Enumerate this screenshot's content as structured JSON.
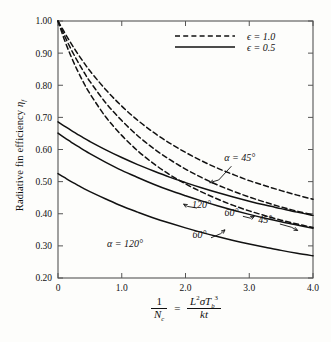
{
  "chart_data": {
    "type": "line",
    "title": "",
    "xlabel": "1/Nc = L^2 sigma Tb^3 / (k t)",
    "ylabel": "Radiative fin efficiency eta_f",
    "xlim": [
      0,
      4.0
    ],
    "ylim": [
      0.2,
      1.0
    ],
    "grid": false,
    "xticks": [
      "0",
      "1.0",
      "2.0",
      "3.0",
      "4.0"
    ],
    "xtick_values": [
      0,
      1.0,
      2.0,
      3.0,
      4.0
    ],
    "yticks": [
      "0.20",
      "0.30",
      "0.40",
      "0.50",
      "0.60",
      "0.70",
      "0.80",
      "0.90",
      "1.00"
    ],
    "ytick_values": [
      0.2,
      0.3,
      0.4,
      0.5,
      0.6,
      0.7,
      0.8,
      0.9,
      1.0
    ],
    "legend_position": "top-right",
    "x": [
      0,
      0.1,
      0.2,
      0.3,
      0.4,
      0.5,
      0.75,
      1.0,
      1.25,
      1.5,
      1.75,
      2.0,
      2.25,
      2.5,
      2.75,
      3.0,
      3.25,
      3.5,
      3.75,
      4.0
    ],
    "series": [
      {
        "name": "eps = 1.0, alpha = 45 deg",
        "emissivity": 1.0,
        "alpha_deg": 45,
        "style": "dashed",
        "values": [
          1.0,
          0.965,
          0.932,
          0.901,
          0.872,
          0.845,
          0.786,
          0.735,
          0.691,
          0.653,
          0.62,
          0.591,
          0.565,
          0.542,
          0.522,
          0.503,
          0.487,
          0.472,
          0.458,
          0.445
        ]
      },
      {
        "name": "eps = 1.0, alpha = 60 deg",
        "emissivity": 1.0,
        "alpha_deg": 60,
        "style": "dashed",
        "values": [
          1.0,
          0.955,
          0.914,
          0.877,
          0.843,
          0.812,
          0.745,
          0.69,
          0.643,
          0.603,
          0.569,
          0.539,
          0.513,
          0.49,
          0.47,
          0.452,
          0.436,
          0.421,
          0.408,
          0.396
        ]
      },
      {
        "name": "eps = 1.0, alpha = 120 deg",
        "emissivity": 1.0,
        "alpha_deg": 120,
        "style": "dashed",
        "values": [
          1.0,
          0.942,
          0.892,
          0.848,
          0.809,
          0.774,
          0.701,
          0.644,
          0.596,
          0.556,
          0.522,
          0.493,
          0.468,
          0.446,
          0.426,
          0.409,
          0.394,
          0.38,
          0.368,
          0.357
        ]
      },
      {
        "name": "eps = 0.5, alpha = 45 deg",
        "emissivity": 0.5,
        "alpha_deg": 45,
        "style": "solid",
        "values": [
          0.686,
          0.673,
          0.66,
          0.648,
          0.636,
          0.625,
          0.599,
          0.575,
          0.553,
          0.533,
          0.514,
          0.497,
          0.481,
          0.466,
          0.452,
          0.439,
          0.427,
          0.416,
          0.405,
          0.395
        ]
      },
      {
        "name": "eps = 0.5, alpha = 60 deg",
        "emissivity": 0.5,
        "alpha_deg": 60,
        "style": "solid",
        "values": [
          0.651,
          0.637,
          0.624,
          0.611,
          0.599,
          0.587,
          0.56,
          0.535,
          0.513,
          0.492,
          0.473,
          0.456,
          0.44,
          0.425,
          0.411,
          0.398,
          0.386,
          0.375,
          0.365,
          0.355
        ]
      },
      {
        "name": "eps = 0.5, alpha = 120 deg",
        "emissivity": 0.5,
        "alpha_deg": 120,
        "style": "solid",
        "values": [
          0.525,
          0.513,
          0.501,
          0.49,
          0.479,
          0.469,
          0.446,
          0.424,
          0.405,
          0.387,
          0.371,
          0.356,
          0.342,
          0.329,
          0.317,
          0.306,
          0.296,
          0.286,
          0.277,
          0.269
        ]
      }
    ],
    "annotations": [
      {
        "text": "α = 45°",
        "x": 2.85,
        "y": 0.565
      },
      {
        "text": "120°",
        "x": 2.25,
        "y": 0.418
      },
      {
        "text": "60°",
        "x": 2.72,
        "y": 0.393
      },
      {
        "text": "45°",
        "x": 3.25,
        "y": 0.37
      },
      {
        "text": "60°",
        "x": 2.22,
        "y": 0.326
      },
      {
        "text": "α = 120°",
        "x": 1.05,
        "y": 0.295
      }
    ]
  },
  "axis": {
    "ylabel_prefix": "Radiative fin efficiency ",
    "ylabel_symbol": "η",
    "ylabel_sub": "f",
    "xlabel_num": "1",
    "xlabel_den": "N",
    "xlabel_den_sub": "c",
    "xlabel_eq": "=",
    "xlabel_rhs_num_L": "L",
    "xlabel_rhs_num_Lsup": "2",
    "xlabel_rhs_num_sigma": "σ",
    "xlabel_rhs_num_T": "T",
    "xlabel_rhs_num_Tsub": "b",
    "xlabel_rhs_num_Tsup": "3",
    "xlabel_rhs_den_k": "k",
    "xlabel_rhs_den_t": "t"
  },
  "legend": {
    "entries": [
      {
        "label": "ϵ = 1.0",
        "style": "dashed",
        "symbol": "ϵ",
        "value": "1.0"
      },
      {
        "label": "ϵ = 0.5",
        "style": "solid",
        "symbol": "ϵ",
        "value": "0.5"
      }
    ]
  },
  "colors": {
    "ink": "#111111",
    "axis": "#555555",
    "background": "#fdfdfb"
  }
}
